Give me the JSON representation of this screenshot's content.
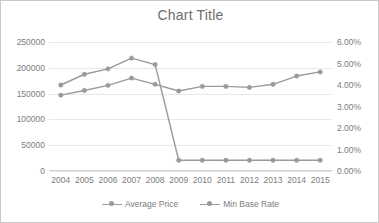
{
  "chart": {
    "title": "Chart Title",
    "frame_border_color": "#c9c9c9",
    "background": "#ffffff",
    "series_color": "#9a9a9a",
    "gridline_color": "#e8e8e8",
    "text_color": "#7d7d7d"
  },
  "legend": {
    "position": "bottom",
    "entries": [
      {
        "label": "Average Price",
        "marker": "circle",
        "color": "#9a9a9a"
      },
      {
        "label": "Min Base Rate",
        "marker": "circle",
        "color": "#9a9a9a"
      }
    ]
  },
  "axes": {
    "left_ticks": [
      "250000",
      "200000",
      "150000",
      "100000",
      "50000",
      "0"
    ],
    "right_ticks": [
      "6.00%",
      "5.00%",
      "4.00%",
      "3.00%",
      "2.00%",
      "1.00%",
      "0.00%"
    ],
    "x_ticks": [
      "2004",
      "2005",
      "2006",
      "2007",
      "2008",
      "2009",
      "2010",
      "2011",
      "2012",
      "2013",
      "2014",
      "2015"
    ]
  },
  "chart_data": {
    "type": "line",
    "title": "Chart Title",
    "xlabel": "",
    "ylabel": "",
    "grid": true,
    "legend_position": "bottom",
    "categories": [
      "2004",
      "2005",
      "2006",
      "2007",
      "2008",
      "2009",
      "2010",
      "2011",
      "2012",
      "2013",
      "2014",
      "2015"
    ],
    "series": [
      {
        "name": "Average Price",
        "axis": "left",
        "color": "#9a9a9a",
        "marker": "circle",
        "values": [
          147000,
          156000,
          166000,
          180000,
          168000,
          155000,
          164000,
          164000,
          162000,
          168000,
          184000,
          192000
        ]
      },
      {
        "name": "Min Base Rate",
        "axis": "right",
        "color": "#9a9a9a",
        "marker": "circle",
        "values": [
          0.04,
          0.045,
          0.0475,
          0.0525,
          0.0495,
          0.005,
          0.005,
          0.005,
          0.005,
          0.005,
          0.005,
          0.005
        ]
      }
    ],
    "left_axis": {
      "min": 0,
      "max": 250000,
      "step": 50000,
      "tick_labels": [
        "0",
        "50000",
        "100000",
        "150000",
        "200000",
        "250000"
      ]
    },
    "right_axis": {
      "min": 0,
      "max": 0.06,
      "step": 0.01,
      "format": "percent",
      "tick_labels": [
        "0.00%",
        "1.00%",
        "2.00%",
        "3.00%",
        "4.00%",
        "5.00%",
        "6.00%"
      ]
    }
  }
}
